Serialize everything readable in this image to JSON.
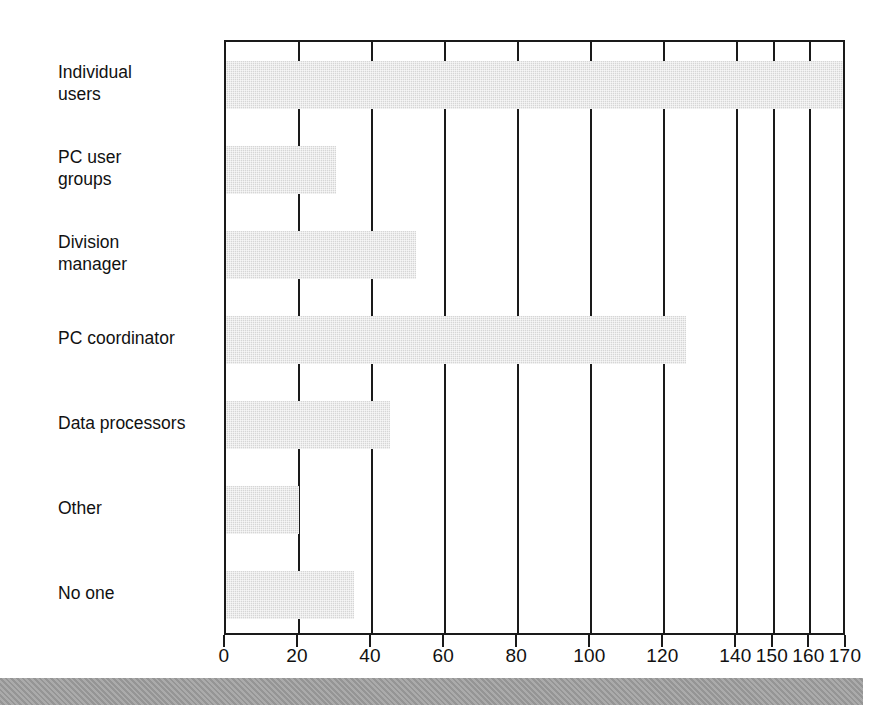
{
  "chart_data": {
    "type": "bar",
    "orientation": "horizontal",
    "title": "",
    "subtitle": "",
    "xlabel": "",
    "ylabel": "",
    "categories": [
      "Individual\nusers",
      "PC user\ngroups",
      "Division\nmanager",
      "PC coordinator",
      "Data processors",
      "Other",
      "No one"
    ],
    "values": [
      169,
      30,
      52,
      126,
      45,
      20,
      35
    ],
    "xlim": [
      0,
      170
    ],
    "xticks": [
      0,
      20,
      40,
      60,
      80,
      100,
      120,
      140,
      150,
      160,
      170
    ],
    "xtick_labels": [
      "0",
      "20",
      "40",
      "60",
      "80",
      "100",
      "120",
      "140",
      "150",
      "160",
      "170"
    ],
    "grid": true,
    "grid_axis": "x",
    "legend": false,
    "legend_position": "none",
    "bar_color": "#d6d6d6",
    "axis_color": "#1a1a1a",
    "annotations": []
  },
  "figure": {
    "background_color": "#ffffff",
    "footer_band_color": "#9e9e9e"
  }
}
